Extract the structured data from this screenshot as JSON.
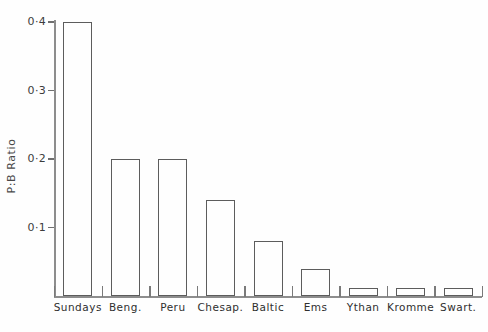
{
  "chart_data": {
    "type": "bar",
    "title": "",
    "subtitle": "",
    "xlabel": "",
    "ylabel": "P:B Ratio",
    "categories": [
      "Sundays",
      "Beng.",
      "Peru",
      "Chesap.",
      "Baltic",
      "Ems",
      "Ythan",
      "Kromme",
      "Swart."
    ],
    "values": [
      0.4,
      0.2,
      0.2,
      0.14,
      0.08,
      0.04,
      0.012,
      0.012,
      0.012
    ],
    "ylim": [
      0,
      0.42
    ],
    "ytick_values": [
      0.1,
      0.2,
      0.3,
      0.4
    ],
    "ytick_labels": [
      "0·1",
      "0·2",
      "0·3",
      "0·4"
    ],
    "grid": false,
    "legend": null,
    "bar_style": "hollow-outline",
    "colors": {
      "background": "#fefefe",
      "axis": "#8d8d8d",
      "bar_outline": "#5c5c5c",
      "text": "#2f2f2f"
    }
  },
  "axis": {
    "y_label": "P:B Ratio",
    "ticks": [
      {
        "label": "0·4",
        "value": 0.4
      },
      {
        "label": "0·3",
        "value": 0.3
      },
      {
        "label": "0·2",
        "value": 0.2
      },
      {
        "label": "0·1",
        "value": 0.1
      }
    ]
  },
  "bars": [
    {
      "label": "Sundays",
      "value": 0.4
    },
    {
      "label": "Beng.",
      "value": 0.2
    },
    {
      "label": "Peru",
      "value": 0.2
    },
    {
      "label": "Chesap.",
      "value": 0.14
    },
    {
      "label": "Baltic",
      "value": 0.08
    },
    {
      "label": "Ems",
      "value": 0.04
    },
    {
      "label": "Ythan",
      "value": 0.012
    },
    {
      "label": "Kromme",
      "value": 0.012
    },
    {
      "label": "Swart.",
      "value": 0.012
    }
  ]
}
